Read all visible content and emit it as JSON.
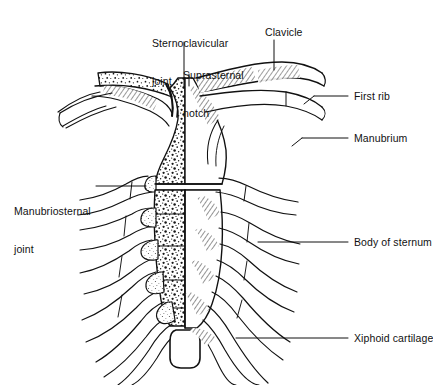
{
  "figure": {
    "ink_color": "#111111",
    "background_color": "#ffffff",
    "stipple_color": "#1a1a1a",
    "cartilage_fill": "#f2f0ec"
  },
  "labels": {
    "sternoclavicular_joint": {
      "line1": "Sternoclavicular",
      "line2": "joint"
    },
    "suprasternal_notch": {
      "line1": "Suprasternal",
      "line2": "notch"
    },
    "clavicle": "Clavicle",
    "first_rib": "First rib",
    "manubrium": "Manubrium",
    "body_of_sternum": "Body of sternum",
    "xiphoid_cartilage": "Xiphoid cartilage",
    "manubriosternal_joint": {
      "line1": "Manubriosternal",
      "line2": "joint"
    }
  }
}
